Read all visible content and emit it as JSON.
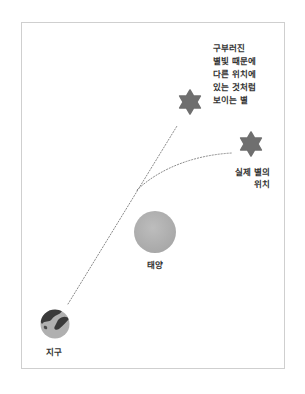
{
  "diagram": {
    "title": "",
    "nodes": {
      "apparent_star": {
        "label_lines": [
          "구부러진",
          "별빛 때문에",
          "다른 위치에",
          "있는 것처럼",
          "보이는 별"
        ],
        "icon": "star-icon",
        "color": "#6f6f6f"
      },
      "real_star": {
        "label_lines": [
          "실제 별의",
          "위치"
        ],
        "icon": "star-icon",
        "color": "#6f6f6f"
      },
      "sun": {
        "label": "태양",
        "icon": "sun-circle-icon",
        "color": "#b3b3b3"
      },
      "earth": {
        "label": "지구",
        "icon": "earth-globe-icon",
        "color": "#a9a9a9"
      }
    },
    "edges": [
      {
        "from": "earth",
        "to": "apparent_star",
        "style": "dotted",
        "meaning": "apparent line of sight"
      },
      {
        "from": "sun_vicinity",
        "to": "real_star",
        "style": "dotted-curve",
        "meaning": "bent starlight path"
      }
    ],
    "colors": {
      "frame_border": "#cfcfcf",
      "dotted_line": "#8a8a8a",
      "text": "#333333"
    }
  }
}
